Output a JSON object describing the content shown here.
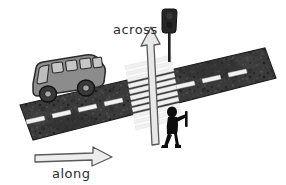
{
  "illustration": {
    "title": "along and across directions on a road",
    "background_color": "#ffffff"
  },
  "labels": {
    "across": {
      "text": "across",
      "color": "#2b2b2b"
    },
    "along": {
      "text": "along",
      "color": "#2b2b2b"
    }
  },
  "arrows": {
    "across_arrow": {
      "name": "across-arrow",
      "direction": "up",
      "fill": "#e8e8e8",
      "stroke": "#555555"
    },
    "along_arrow": {
      "name": "along-arrow",
      "direction": "right",
      "fill": "#ededed",
      "stroke": "#555555"
    }
  },
  "road": {
    "name": "road-surface",
    "fill": "#3a3a3a",
    "texture": "asphalt-speckle",
    "lane_marking_color": "#f2f2f2",
    "lane_dashes": 7,
    "crosswalk": {
      "name": "zebra-crosswalk",
      "stripe_color": "#f0f0f0",
      "stripe_count": 13
    }
  },
  "vehicle": {
    "name": "bus",
    "body_fill": "#8c8c8c",
    "outline": "#2b2b2b",
    "window_fill": "#bdbdbd",
    "window_count": 4,
    "wheel_fill": "#3a3a3a",
    "wheel_count": 2
  },
  "pedestrian": {
    "name": "pedestrian-silhouette",
    "fill": "#0d0d0d"
  },
  "traffic_light": {
    "name": "traffic-light",
    "housing_fill": "#262626",
    "pole_fill": "#1f1f1f"
  }
}
